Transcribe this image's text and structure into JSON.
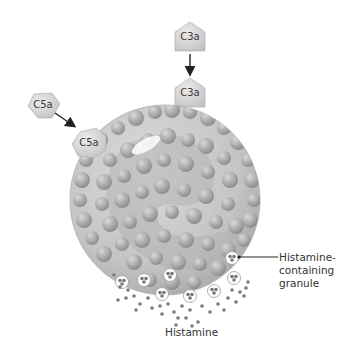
{
  "diagram": {
    "type": "mast cell degranulation by anaphylatoxins",
    "molecules": [
      {
        "id": "c3a-free",
        "label": "C3a",
        "shape": "pentagon",
        "x": 190,
        "y": 37
      },
      {
        "id": "c3a-bound",
        "label": "C3a",
        "shape": "pentagon",
        "x": 190,
        "y": 93
      },
      {
        "id": "c5a-free",
        "label": "C5a",
        "shape": "rounded-hexagon",
        "x": 42,
        "y": 104
      },
      {
        "id": "c5a-bound",
        "label": "C5a",
        "shape": "rounded-hexagon",
        "x": 90,
        "y": 140
      }
    ],
    "arrows": [
      {
        "from": "c3a-free",
        "to": "c3a-bound"
      },
      {
        "from": "c5a-free",
        "to": "c5a-bound"
      }
    ],
    "cell": {
      "name": "mast cell",
      "cx": 165,
      "cy": 200,
      "r": 95
    },
    "labels": {
      "granule_line1": "Histamine-",
      "granule_line2": "containing",
      "granule_line3": "granule",
      "histamine": "Histamine"
    },
    "colors": {
      "cell_fill": "#c9c9c9",
      "granule": "#a8a8a8",
      "molecule_fill": "#d6d6d6",
      "histamine_dot": "#7a7a7a",
      "arrow": "#222222"
    }
  }
}
